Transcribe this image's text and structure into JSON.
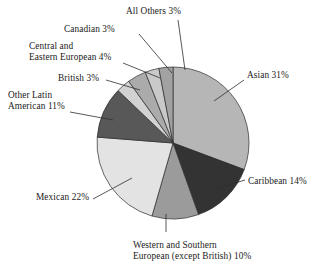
{
  "chart_data": {
    "type": "pie",
    "title": "",
    "subtitle": "",
    "xlabel": "",
    "ylabel": "",
    "legend_position": "none",
    "grid": false,
    "units": "percent",
    "label_format": "{name} {value}%",
    "start_angle_deg": 0,
    "direction": "clockwise",
    "categories": [
      "Asian",
      "Caribbean",
      "Western and Southern European (except British)",
      "Mexican",
      "Other Latin American",
      "British",
      "Central and Eastern European",
      "Canadian",
      "All Others"
    ],
    "values": [
      31,
      14,
      10,
      22,
      11,
      3,
      4,
      3,
      3
    ],
    "slices": [
      {
        "name": "Asian",
        "value": 31,
        "label": "Asian 31%",
        "color": "#b6b6b6",
        "label_lines": [
          "Asian 31%"
        ]
      },
      {
        "name": "Caribbean",
        "value": 14,
        "label": "Caribbean 14%",
        "color": "#333333",
        "label_lines": [
          "Caribbean 14%"
        ]
      },
      {
        "name": "Western and Southern European (except British)",
        "value": 10,
        "label": "Western and Southern European (except British) 10%",
        "color": "#9b9b9b",
        "label_lines": [
          "Western and Southern",
          "European (except British) 10%"
        ]
      },
      {
        "name": "Mexican",
        "value": 22,
        "label": "Mexican 22%",
        "color": "#e3e3e3",
        "label_lines": [
          "Mexican 22%"
        ]
      },
      {
        "name": "Other Latin American",
        "value": 11,
        "label": "Other Latin American 11%",
        "color": "#585858",
        "label_lines": [
          "Other Latin",
          "American 11%"
        ]
      },
      {
        "name": "British",
        "value": 3,
        "label": "British 3%",
        "color": "#d2d2d2",
        "label_lines": [
          "British 3%"
        ]
      },
      {
        "name": "Central and Eastern European",
        "value": 4,
        "label": "Central and Eastern European 4%",
        "color": "#ababab",
        "label_lines": [
          "Central and",
          "Eastern European 4%"
        ]
      },
      {
        "name": "Canadian",
        "value": 3,
        "label": "Canadian 3%",
        "color": "#c9c9c9",
        "label_lines": [
          "Canadian 3%"
        ]
      },
      {
        "name": "All Others",
        "value": 3,
        "label": "All Others 3%",
        "color": "#a2a2a2",
        "label_lines": [
          "All Others 3%"
        ]
      }
    ],
    "total": 101,
    "colors": {
      "background": "#ffffff",
      "text": "#1a1a1a",
      "outline": "#2b2b2b",
      "leader": "#2f2f2f"
    }
  }
}
